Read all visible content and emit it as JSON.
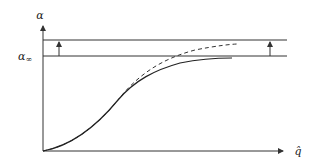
{
  "diagram": {
    "y_axis_label": "α",
    "x_axis_label": "q̂",
    "asymptote_label": "α∞",
    "asymptote_label_base": "α",
    "asymptote_label_sub": "∞",
    "curves": [
      {
        "name": "solid-curve",
        "style": "solid",
        "description": "saturating curve approaching lower line"
      },
      {
        "name": "dashed-curve",
        "style": "dashed",
        "description": "curve approaching upper line"
      }
    ],
    "lines": [
      {
        "name": "upper-line",
        "y": 40
      },
      {
        "name": "lower-line",
        "y": 56
      }
    ],
    "colors": {
      "stroke": "#333333",
      "background": "#ffffff"
    }
  }
}
